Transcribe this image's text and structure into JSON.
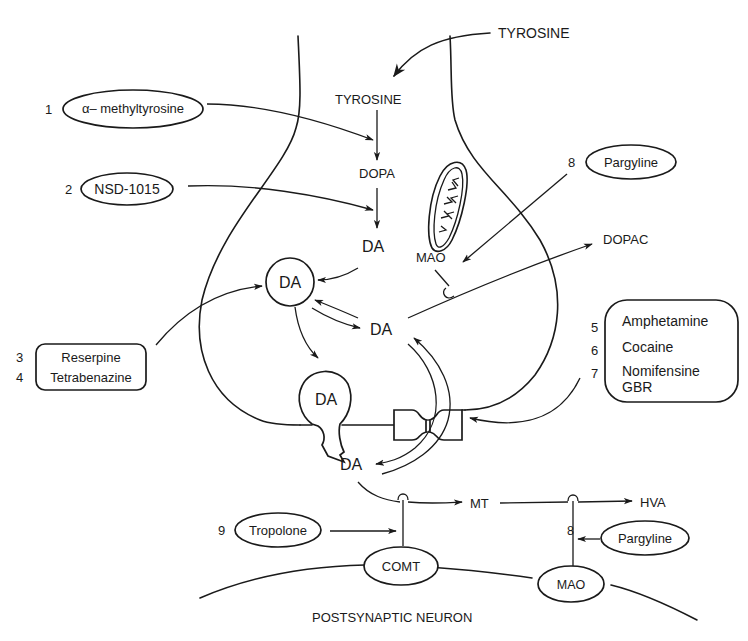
{
  "diagram": {
    "type": "dopaminergic-synapse-pharmacology",
    "colors": {
      "ink": "#1a1a1a",
      "background": "#ffffff"
    },
    "presynaptic": {
      "extracellular_precursor": "TYROSINE",
      "intracellular_precursor": "TYROSINE",
      "intermediate": "DOPA",
      "cytoplasmic_da": "DA",
      "vesicle_da": "DA",
      "releasing_vesicle_da": "DA",
      "free_da": "DA",
      "mitochondrial_enzyme": "MAO",
      "metabolite": "DOPAC"
    },
    "synaptic_cleft": {
      "synaptic_da": "DA",
      "comt_metabolite": "MT",
      "final_metabolite": "HVA"
    },
    "postsynaptic": {
      "label": "POSTSYNAPTIC NEURON",
      "enzymes": [
        "COMT",
        "MAO"
      ]
    },
    "drugs": [
      {
        "number": "1",
        "name": "α– methyltyrosine"
      },
      {
        "number": "2",
        "name": "NSD-1015"
      },
      {
        "numbers": [
          "3",
          "4"
        ],
        "names": [
          "Reserpine",
          "Tetrabenazine"
        ]
      },
      {
        "numbers": [
          "5",
          "6",
          "7"
        ],
        "names": [
          "Amphetamine",
          "Cocaine",
          "Nomifensine",
          "GBR"
        ]
      },
      {
        "number": "8",
        "name": "Pargyline"
      },
      {
        "number": "9",
        "name": "Tropolone"
      },
      {
        "number": "8",
        "name": "Pargyline"
      }
    ]
  }
}
